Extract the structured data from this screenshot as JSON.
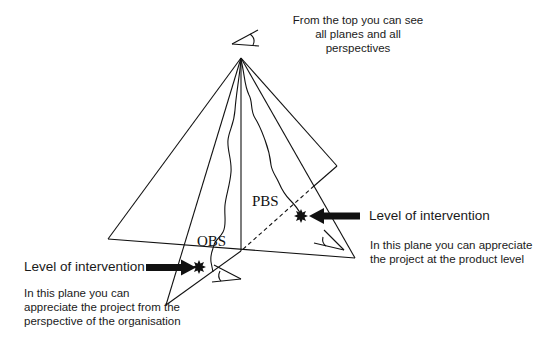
{
  "diagram": {
    "type": "pyramid-planes",
    "top_note": "From the top you can see all planes and all perspectives",
    "labels": {
      "pbs": "PBS",
      "obs": "OBS"
    },
    "right_annotation": {
      "title": "Level of intervention",
      "description": "In this plane you can appreciate the project at the product level"
    },
    "left_annotation": {
      "title": "Level of intervention",
      "description": "In this plane you can appreciate the project from the perspective of the organisation"
    },
    "icons": [
      "eye-top-icon",
      "eye-right-icon",
      "eye-left-icon",
      "arrow-right-icon",
      "arrow-left-icon",
      "star-burst-right-icon",
      "star-burst-left-icon"
    ],
    "colors": {
      "line": "#111111",
      "background": "#ffffff"
    }
  }
}
